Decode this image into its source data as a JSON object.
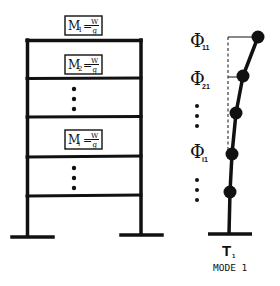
{
  "diagram": {
    "frame": {
      "mass_labels": [
        {
          "mass": "M",
          "sub": "1",
          "num": "W",
          "num_sub": "1",
          "den": "g"
        },
        {
          "mass": "M",
          "sub": "2",
          "num": "W",
          "num_sub": "2",
          "den": "g"
        },
        {
          "mass": "M",
          "sub": "i",
          "num": "W",
          "num_sub": "i",
          "den": "g"
        }
      ],
      "ellipsis": "⋮"
    },
    "mode_shape": {
      "labels": [
        {
          "phi": "Φ",
          "sub": "11"
        },
        {
          "phi": "Φ",
          "sub": "21"
        },
        {
          "phi": "Φ",
          "sub": "i1"
        }
      ],
      "period_symbol": "T",
      "period_sub": "1",
      "caption": "MODE 1"
    },
    "colors": {
      "ink": "#111111",
      "background": "#ffffff"
    }
  }
}
